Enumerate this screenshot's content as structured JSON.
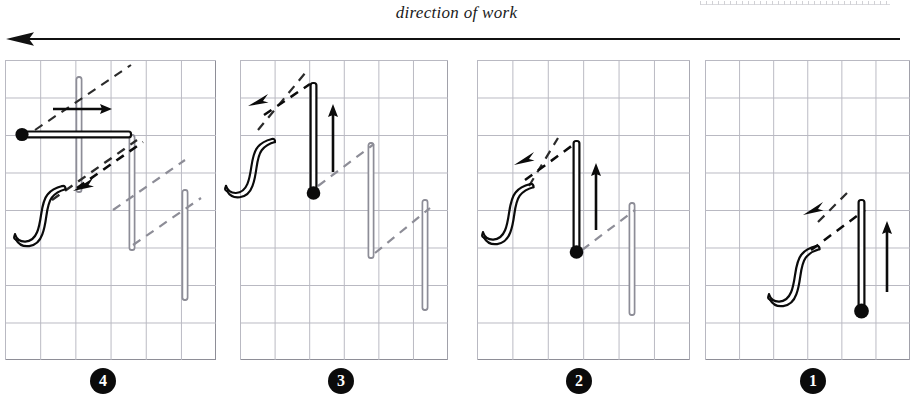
{
  "header": {
    "title": "direction of work",
    "arrow_direction": "left",
    "arrow_icon": "long-left-arrow-icon",
    "scan_artifact": "ruler-scan-artifact"
  },
  "diagram": {
    "panel_count": 4,
    "grid": {
      "columns": 6,
      "rows": 8,
      "cell_px": 38,
      "visible": true
    },
    "colors": {
      "ink": "#0b0b0b",
      "installed_pile": "#8d8d97",
      "grid_line": "#b9b9c2",
      "frame": "#8e8e97",
      "background": "#ffffff"
    },
    "legend_semantics": {
      "black_pile": "pile currently being placed",
      "gray_pile": "pile already driven",
      "solid_arrow": "movement of the pile being placed",
      "dashed_arrow": "direction of advance / interlock guide",
      "squiggle": "ground surface / soil symbol",
      "dot": "pile toe (driving point)"
    },
    "panels": [
      {
        "step_label": "4",
        "step_number": 4,
        "name": "panel-step-4",
        "x": 5,
        "y": 60,
        "width": 211,
        "height": 300,
        "solid_arrow": {
          "label": "rotation to horizontal",
          "direction": "right"
        },
        "dashed_arrow": {
          "label": "advance direction",
          "direction": "down-left"
        },
        "active_pile_orientation": "horizontal",
        "installed_piles": 3,
        "squiggle": true
      },
      {
        "step_label": "3",
        "step_number": 3,
        "name": "panel-step-3",
        "x": 240,
        "y": 60,
        "width": 208,
        "height": 300,
        "solid_arrow": {
          "label": "driving direction",
          "direction": "up"
        },
        "dashed_arrow": {
          "label": "advance direction",
          "direction": "down-left"
        },
        "active_pile_orientation": "vertical",
        "installed_piles": 2,
        "squiggle": true
      },
      {
        "step_label": "2",
        "step_number": 2,
        "name": "panel-step-2",
        "x": 477,
        "y": 60,
        "width": 213,
        "height": 300,
        "solid_arrow": {
          "label": "driving direction",
          "direction": "up"
        },
        "dashed_arrow": {
          "label": "advance direction",
          "direction": "down-left"
        },
        "active_pile_orientation": "vertical",
        "installed_piles": 1,
        "squiggle": true
      },
      {
        "step_label": "1",
        "step_number": 1,
        "name": "panel-step-1",
        "x": 705,
        "y": 60,
        "width": 205,
        "height": 300,
        "solid_arrow": {
          "label": "driving direction",
          "direction": "up"
        },
        "dashed_arrow": {
          "label": "advance direction",
          "direction": "down-left"
        },
        "active_pile_orientation": "vertical",
        "installed_piles": 0,
        "squiggle": true
      }
    ],
    "badges": [
      {
        "label": "4",
        "x": 90
      },
      {
        "label": "3",
        "x": 328
      },
      {
        "label": "2",
        "x": 566
      },
      {
        "label": "1",
        "x": 800
      }
    ]
  }
}
